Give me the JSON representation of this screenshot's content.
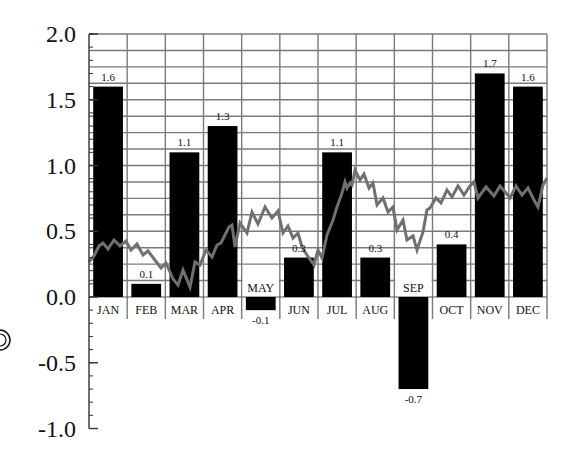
{
  "chart_data": {
    "type": "bar",
    "title": "",
    "xlabel": "",
    "ylabel": "",
    "ylim": [
      -1.0,
      2.0
    ],
    "yticks": [
      "2.0",
      "1.5",
      "1.0",
      "0.5",
      "0.0",
      "-0.5",
      "-1.0"
    ],
    "grid": true,
    "legend": null,
    "categories": [
      "JAN",
      "FEB",
      "MAR",
      "APR",
      "MAY",
      "JUN",
      "JUL",
      "AUG",
      "SEP",
      "OCT",
      "NOV",
      "DEC"
    ],
    "series": [
      {
        "name": "monthly",
        "type": "bar",
        "color": "#000000",
        "values": [
          1.6,
          0.1,
          1.1,
          1.3,
          -0.1,
          0.3,
          1.1,
          0.3,
          -0.7,
          0.4,
          1.7,
          1.6
        ],
        "labels": [
          "1.6",
          "0.1",
          "1.1",
          "1.3",
          "-0.1",
          "0.3",
          "1.1",
          "0.3",
          "-0.7",
          "0.4",
          "1.7",
          "1.6"
        ]
      },
      {
        "name": "trend",
        "type": "line",
        "color": "#666666",
        "approx_values_by_month": [
          0.4,
          0.35,
          0.15,
          0.35,
          0.6,
          0.3,
          0.75,
          0.7,
          0.45,
          0.75,
          0.8,
          0.8
        ]
      }
    ]
  },
  "annotations": {
    "left_edge_symbol": "circled glyph (partially cropped)"
  }
}
